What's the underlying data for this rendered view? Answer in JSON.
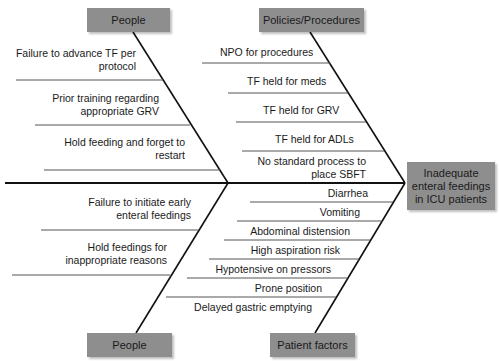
{
  "diagram": {
    "type": "fishbone",
    "effect": "Inadequate enteral feedings in ICU patients",
    "effect_lines": [
      "Inadequate",
      "enteral feedings",
      "in ICU patients"
    ],
    "categories": [
      {
        "name": "People",
        "position": "top-left",
        "causes": [
          {
            "lines": [
              "Failure to advance TF per",
              "protocol"
            ]
          },
          {
            "lines": [
              "Prior training regarding",
              "appropriate GRV"
            ]
          },
          {
            "lines": [
              "Hold feeding and forget to",
              "restart"
            ]
          }
        ]
      },
      {
        "name": "Policies/Procedures",
        "position": "top-right",
        "causes": [
          {
            "lines": [
              "NPO for procedures"
            ]
          },
          {
            "lines": [
              "TF held for meds"
            ]
          },
          {
            "lines": [
              "TF held for GRV"
            ]
          },
          {
            "lines": [
              "TF held for ADLs"
            ]
          },
          {
            "lines": [
              "No standard process to",
              "place SBFT"
            ]
          }
        ]
      },
      {
        "name": "People",
        "position": "bottom-left",
        "causes": [
          {
            "lines": [
              "Failure to initiate early",
              "enteral feedings"
            ]
          },
          {
            "lines": [
              "Hold feedings for",
              "inappropriate reasons"
            ]
          }
        ]
      },
      {
        "name": "Patient factors",
        "position": "bottom-right",
        "causes": [
          {
            "lines": [
              "Diarrhea"
            ]
          },
          {
            "lines": [
              "Vomiting"
            ]
          },
          {
            "lines": [
              "Abdominal distension"
            ]
          },
          {
            "lines": [
              "High aspiration risk"
            ]
          },
          {
            "lines": [
              "Hypotensive on pressors"
            ]
          },
          {
            "lines": [
              "Prone position"
            ]
          },
          {
            "lines": [
              "Delayed gastric emptying"
            ]
          }
        ]
      }
    ]
  },
  "colors": {
    "box_fill": "#8e8e8e",
    "line": "#111111",
    "sub_line": "#555555",
    "background": "#ffffff"
  }
}
